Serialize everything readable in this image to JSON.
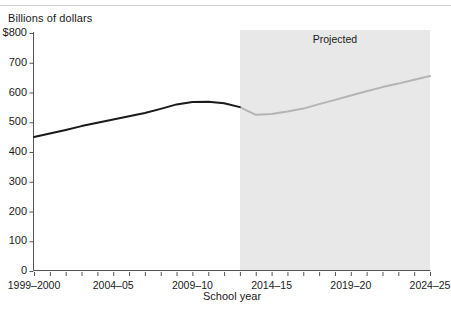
{
  "chart_data": {
    "type": "line",
    "title": "",
    "subtitle": "",
    "ylabel": "Billions of dollars",
    "xlabel": "School year",
    "ylim": [
      0,
      800
    ],
    "yticks": [
      "$800",
      "700",
      "600",
      "500",
      "400",
      "300",
      "200",
      "100",
      "0"
    ],
    "ytick_values": [
      800,
      700,
      600,
      500,
      400,
      300,
      200,
      100,
      0
    ],
    "xticks_labeled": [
      "1999–2000",
      "2004–05",
      "2009–10",
      "2014–15",
      "2019–20",
      "2024–25"
    ],
    "grid": false,
    "legend": null,
    "annotations": [
      {
        "text": "Projected",
        "x": "2017–18"
      }
    ],
    "shaded_region": {
      "label": "Projected",
      "from": "2012–13",
      "to": "2024–25",
      "color": "#e8e8e8"
    },
    "x": [
      "1999–2000",
      "2000–01",
      "2001–02",
      "2002–03",
      "2003–04",
      "2004–05",
      "2005–06",
      "2006–07",
      "2007–08",
      "2008–09",
      "2009–10",
      "2010–11",
      "2011–12",
      "2012–13",
      "2013–14",
      "2014–15",
      "2015–16",
      "2016–17",
      "2017–18",
      "2018–19",
      "2019–20",
      "2020–21",
      "2021–22",
      "2022–23",
      "2023–24",
      "2024–25"
    ],
    "series": [
      {
        "name": "Actual",
        "color": "#1a1a1a",
        "values": [
          450,
          462,
          474,
          487,
          498,
          509,
          520,
          531,
          545,
          560,
          568,
          569,
          564,
          551,
          null,
          null,
          null,
          null,
          null,
          null,
          null,
          null,
          null,
          null,
          null,
          null
        ]
      },
      {
        "name": "Projected",
        "color": "#b4b4b4",
        "values": [
          null,
          null,
          null,
          null,
          null,
          null,
          null,
          null,
          null,
          null,
          null,
          null,
          null,
          551,
          525,
          528,
          536,
          546,
          561,
          575,
          590,
          604,
          618,
          630,
          643,
          655
        ]
      }
    ]
  },
  "axis": {
    "unit_label": "Billions of dollars",
    "x_title": "School year",
    "y_labels": [
      "$800",
      "700",
      "600",
      "500",
      "400",
      "300",
      "200",
      "100",
      "0"
    ],
    "x_labels": [
      "1999–2000",
      "2004–05",
      "2009–10",
      "2014–15",
      "2019–20",
      "2024–25"
    ]
  },
  "labels": {
    "projected": "Projected"
  },
  "colors": {
    "actual_line": "#1a1a1a",
    "projected_line": "#b4b4b4",
    "shading": "#e8e8e8",
    "axis": "#555555",
    "rule": "#d2d2d2"
  }
}
